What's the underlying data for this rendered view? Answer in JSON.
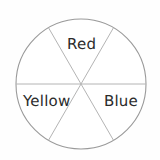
{
  "figure": {
    "type": "spinner-wheel",
    "shape": "circle",
    "sector_count": 6,
    "sector_angle_degrees": 60,
    "center": {
      "x": 81,
      "y": 84
    },
    "radius": 65,
    "background_color": "#fefefe",
    "stroke_color": "#9a9a9a",
    "stroke_width": "1"
  },
  "labels": {
    "red": "Red",
    "yellow": "Yellow",
    "blue": "Blue"
  },
  "sectors": [
    {
      "name": "red",
      "label": "Red",
      "position": "top",
      "start_angle": -30,
      "end_angle": 30,
      "labeled": true
    },
    {
      "name": "upper-right",
      "label": "",
      "position": "upper-right",
      "start_angle": 30,
      "end_angle": 90,
      "labeled": false
    },
    {
      "name": "blue",
      "label": "Blue",
      "position": "lower-right",
      "start_angle": 90,
      "end_angle": 150,
      "labeled": true
    },
    {
      "name": "bottom",
      "label": "",
      "position": "bottom",
      "start_angle": 150,
      "end_angle": 210,
      "labeled": false
    },
    {
      "name": "yellow",
      "label": "Yellow",
      "position": "lower-left",
      "start_angle": 210,
      "end_angle": 270,
      "labeled": true
    },
    {
      "name": "upper-left",
      "label": "",
      "position": "upper-left",
      "start_angle": 270,
      "end_angle": 330,
      "labeled": false
    }
  ],
  "dividers": [
    {
      "name": "horizontal-diameter",
      "angle_degrees": 0
    },
    {
      "name": "diagonal-diameter-up-right",
      "angle_degrees": 60
    },
    {
      "name": "diagonal-diameter-up-left",
      "angle_degrees": 120
    }
  ],
  "colors": {
    "outline": "#9a9a9a",
    "spoke": "#b0b0b0",
    "text": "#2b2b2b",
    "background": "#fefefe"
  }
}
